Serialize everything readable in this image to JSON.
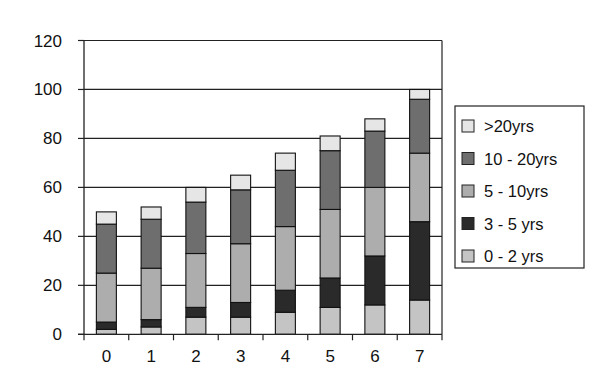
{
  "chart_data": {
    "type": "bar",
    "stacked": true,
    "title": "",
    "xlabel": "",
    "ylabel": "",
    "ylim": [
      0,
      120
    ],
    "yticks": [
      0,
      20,
      40,
      60,
      80,
      100,
      120
    ],
    "grid": true,
    "legend_position": "right",
    "categories": [
      "0",
      "1",
      "2",
      "3",
      "4",
      "5",
      "6",
      "7"
    ],
    "series": [
      {
        "name": "0 - 2 yrs",
        "color": "#c4c4c4",
        "values": [
          2,
          3,
          7,
          7,
          9,
          11,
          12,
          14
        ]
      },
      {
        "name": "3 - 5 yrs",
        "color": "#2a2a2a",
        "values": [
          3,
          3,
          4,
          6,
          9,
          12,
          20,
          32
        ]
      },
      {
        "name": "5 - 10yrs",
        "color": "#adadad",
        "values": [
          20,
          21,
          22,
          24,
          26,
          28,
          28,
          28
        ]
      },
      {
        "name": "10 - 20yrs",
        "color": "#6e6e6e",
        "values": [
          20,
          20,
          21,
          22,
          23,
          24,
          23,
          22
        ]
      },
      {
        "name": ">20yrs",
        "color": "#e6e6e6",
        "values": [
          5,
          5,
          6,
          6,
          7,
          6,
          5,
          4
        ]
      }
    ],
    "totals": [
      50,
      52,
      60,
      65,
      74,
      81,
      88,
      100
    ],
    "legend_order": [
      ">20yrs",
      "10 - 20yrs",
      "5 - 10yrs",
      "3 - 5 yrs",
      "0 - 2 yrs"
    ]
  }
}
